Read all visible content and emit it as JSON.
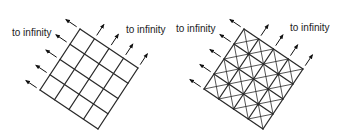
{
  "figure": {
    "panels": [
      {
        "id": "square-grid",
        "grid_size": 4,
        "corners": {
          "top": [
            80,
            29
          ],
          "right": [
            138,
            69
          ],
          "bottom": [
            98,
            129
          ],
          "left": [
            40,
            90
          ]
        },
        "triangulated": false,
        "labels": [
          {
            "text": "to infinity",
            "x": 12,
            "y": 36
          },
          {
            "text": "to infinity",
            "x": 126,
            "y": 33
          }
        ]
      },
      {
        "id": "triangulated-grid",
        "grid_size": 4,
        "corners": {
          "top": [
            244,
            29
          ],
          "right": [
            301,
            71
          ],
          "bottom": [
            263,
            129
          ],
          "left": [
            204,
            89
          ]
        },
        "triangulated": true,
        "labels": [
          {
            "text": "to infinity",
            "x": 176,
            "y": 32
          },
          {
            "text": "to infinity",
            "x": 290,
            "y": 31
          }
        ]
      }
    ],
    "colors": {
      "line": "#2a2a2a",
      "arrow": "#111111",
      "text": "#222222"
    }
  }
}
